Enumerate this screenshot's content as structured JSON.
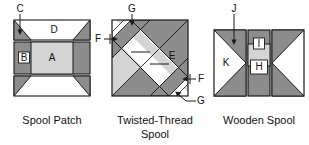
{
  "figure": {
    "background": "#ffffff",
    "colors": {
      "dark_gray": "#8d8d8d",
      "light_gray": "#d4d4d4",
      "white": "#ffffff",
      "outline": "#1a1a1a",
      "text": "#111111"
    }
  },
  "blocks": [
    {
      "id": "spool-patch",
      "caption": "Spool Patch",
      "caption_lines": [
        "Spool Patch"
      ],
      "pieces": [
        {
          "label": "D",
          "fill": "white",
          "shape": "trapezoid-top"
        },
        {
          "label": "C",
          "fill": "dark_gray",
          "shape": "corner-triangle"
        },
        {
          "label": "B",
          "fill": "dark_gray",
          "shape": "rectangle-left"
        },
        {
          "label": "A",
          "fill": "light_gray",
          "shape": "rectangle-center"
        }
      ],
      "callouts": [
        {
          "label": "C",
          "target": "top-left-corner-triangle",
          "arrow": "down"
        }
      ]
    },
    {
      "id": "twisted-thread-spool",
      "caption": "Twisted-Thread Spool",
      "caption_lines": [
        "Twisted-Thread",
        "Spool"
      ],
      "pieces": [
        {
          "label": "E",
          "fill": "white",
          "shape": "triangle-right"
        },
        {
          "label": "F",
          "fill": "white",
          "shape": "diagonal-strip"
        },
        {
          "label": "G",
          "fill": "dark_gray",
          "shape": "diagonal-strip"
        }
      ],
      "callouts": [
        {
          "label": "G",
          "target": "upper-dark-diagonal-strip",
          "arrow": "down"
        },
        {
          "label": "F",
          "target": "upper-white-diagonal-strip",
          "arrow": "right"
        },
        {
          "label": "F",
          "target": "lower-white-diagonal-strip",
          "arrow": "left"
        },
        {
          "label": "G",
          "target": "lower-dark-diagonal-strip",
          "arrow": "left-up"
        }
      ]
    },
    {
      "id": "wooden-spool",
      "caption": "Wooden Spool",
      "caption_lines": [
        "Wooden Spool"
      ],
      "pieces": [
        {
          "label": "K",
          "fill": "white",
          "shape": "side-triangle-panel"
        },
        {
          "label": "J",
          "fill": "dark_gray",
          "shape": "corner-triangle"
        },
        {
          "label": "I",
          "fill": "white",
          "shape": "center-small-square"
        },
        {
          "label": "H",
          "fill": "white",
          "shape": "center-small-square"
        }
      ],
      "callouts": [
        {
          "label": "J",
          "target": "top-left-dark-triangle",
          "arrow": "down"
        }
      ]
    }
  ],
  "labels": {
    "A": "A",
    "B": "B",
    "C": "C",
    "D": "D",
    "E": "E",
    "F": "F",
    "G": "G",
    "H": "H",
    "I": "I",
    "J": "J",
    "K": "K"
  },
  "captions": {
    "block1": "Spool Patch",
    "block2_line1": "Twisted-Thread",
    "block2_line2": "Spool",
    "block3": "Wooden Spool"
  }
}
